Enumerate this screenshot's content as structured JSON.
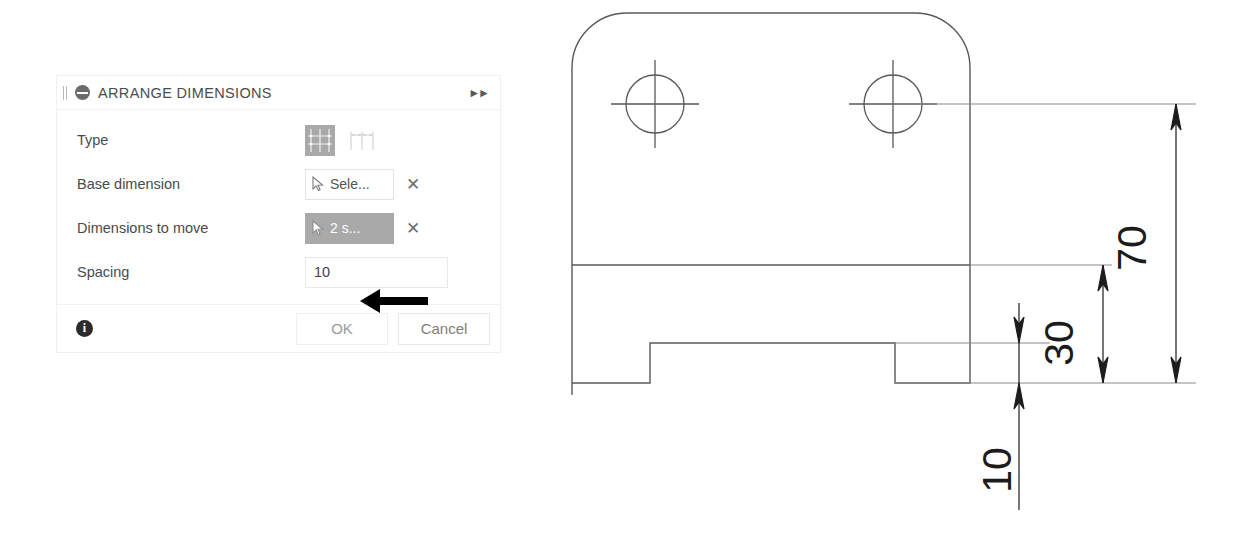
{
  "dialog": {
    "title": "ARRANGE DIMENSIONS",
    "title_icon": "minus-circle-icon",
    "drag_handle_icon": "drag-handle-icon",
    "expand_icon": "double-chevron-right-icon",
    "rows": [
      {
        "label": "Type",
        "control": "icon-toggle-group",
        "options": [
          {
            "icon": "baseline-dimension-icon",
            "selected": true
          },
          {
            "icon": "chain-dimension-icon",
            "selected": false
          }
        ]
      },
      {
        "label": "Base dimension",
        "control": "selection-field",
        "icon": "cursor-arrow-icon",
        "value": "Sele...",
        "active": false,
        "clear_icon": "close-x-icon",
        "clear_label": "✕"
      },
      {
        "label": "Dimensions to move",
        "control": "selection-field",
        "icon": "cursor-arrow-icon",
        "value": "2 s...",
        "active": true,
        "clear_icon": "close-x-icon",
        "clear_label": "✕"
      },
      {
        "label": "Spacing",
        "control": "number-field",
        "value": "10"
      }
    ],
    "footer": {
      "info_icon": "info-circle-icon",
      "ok_label": "OK",
      "cancel_label": "Cancel"
    },
    "annotation": {
      "icon": "annotation-arrow-left-icon",
      "color": "#000000",
      "points_at": "Spacing"
    }
  },
  "drawing": {
    "type": "engineering-drawing",
    "line_color": "#595959",
    "dimension_color": "#1c1c1c",
    "features": [
      {
        "name": "hole",
        "center_x": 655,
        "center_y": 104,
        "radius": 29
      },
      {
        "name": "hole",
        "center_x": 893,
        "center_y": 104,
        "radius": 29
      },
      {
        "name": "rounded-corner-top-left",
        "radius": 55
      },
      {
        "name": "rounded-corner-top-right",
        "radius": 55
      },
      {
        "name": "bottom-notch"
      }
    ],
    "dimensions": [
      {
        "label": "70",
        "value": 70,
        "rotated": true,
        "text_x": 1135,
        "text_y": 248
      },
      {
        "label": "30",
        "value": 30,
        "rotated": true,
        "text_x": 1062,
        "text_y": 343
      },
      {
        "label": "10",
        "value": 10,
        "rotated": true,
        "text_x": 1000,
        "text_y": 470
      }
    ]
  }
}
